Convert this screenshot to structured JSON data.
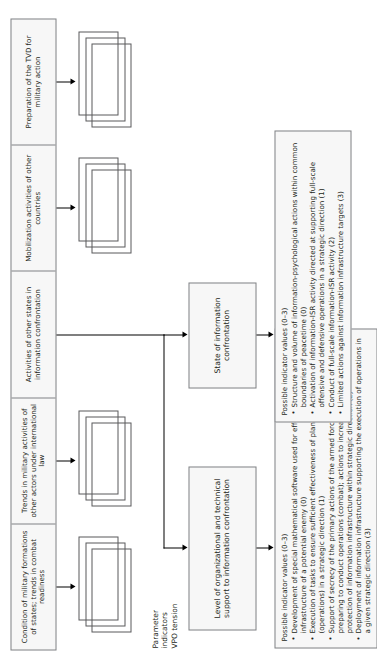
{
  "diagram": {
    "caption": {
      "line1": "Parameter",
      "line2": "indicators",
      "line3": "VPO tension"
    },
    "factors": [
      {
        "id": "condition-of-military-formations",
        "label": "Condition of military formations of states; trends in combat readiness"
      },
      {
        "id": "trends-in-military-activities",
        "label": "Trends in military activities of other actors under international law"
      },
      {
        "id": "activities-of-other-states",
        "label": "Activities of other states in information confrontation"
      },
      {
        "id": "mobilization-activities",
        "label": "Mobilization activities of other countries"
      },
      {
        "id": "preparation-of-the-tvd",
        "label": "Preparation of the TVD for military action"
      }
    ],
    "states": [
      {
        "id": "level-of-organizational-support",
        "label": "Level of organizational and technical support to information confrontation"
      },
      {
        "id": "state-of-information-confrontation",
        "label": "State of information confrontation"
      }
    ],
    "panels": [
      {
        "id": "indicator-values-organizational",
        "title": "Possible indicator values (0–3)",
        "items": [
          "Development of special mathematical software used for effects on the information infrastructure of a potential enemy (0)",
          "Execution of tasks to ensure sufficient effectiveness of planned actions (operations) in a strategic direction (1)",
          "Support of secrecy of the primary actions of the armed forces in the course of preparing to conduct operations (combat); actions to increase reliability and protection of information infrastructure within strategic direction (2)",
          "Deployment of information infrastructure supporting the execution of operations in a given strategic direction (3)"
        ]
      },
      {
        "id": "indicator-values-information-confrontation",
        "title": "Possible indicator values (0–3)",
        "items": [
          "Structure and volume of information-psychological actions within common boundaries of peacetime (0)",
          "Activation of information-ISR activity directed at supporting full-scale offensive and defensive operations in a strategic direction (1)",
          "Conduct of full-scale information-ISR activity (2)",
          "Limited actions against information infrastructure targets (3)"
        ]
      }
    ],
    "colors": {
      "box_fill": "#f7f7f7",
      "box_border": "#808285",
      "stack_border": "#58595b",
      "connector": "#000000",
      "text": "#231f20",
      "page_background": "#ffffff"
    }
  }
}
